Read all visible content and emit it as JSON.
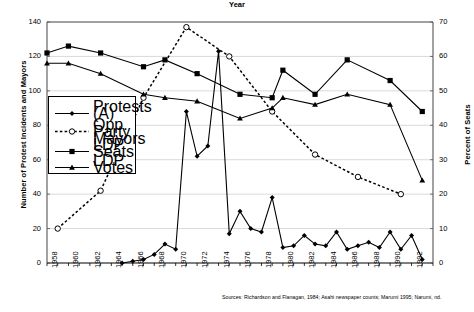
{
  "chart_data": {
    "type": "line",
    "title": "",
    "xlabel": "Year",
    "ylabel": "Number of Protest Incidents and Mayors",
    "ylabel_right": "Percent of Seats",
    "xlim": [
      1958,
      1994
    ],
    "ylim": [
      0,
      140
    ],
    "ylim_right": [
      0,
      70
    ],
    "yticks": [
      0,
      20,
      40,
      60,
      80,
      100,
      120,
      140
    ],
    "yticks_right": [
      0,
      10,
      20,
      30,
      40,
      50,
      60,
      70
    ],
    "xticks": [
      1958,
      1960,
      1962,
      1964,
      1966,
      1968,
      1970,
      1972,
      1974,
      1976,
      1978,
      1980,
      1982,
      1984,
      1986,
      1988,
      1990,
      1992
    ],
    "grid": "horizontal",
    "legend_position": "inside-left",
    "source_note": "Sources: Richardson and Flanagan, 1984; Asahi newspaper counts; Marumi 1995; Narumi, nd.",
    "series": [
      {
        "name": "Protests (A)",
        "axis": "left",
        "marker": "filled-diamond",
        "line": "solid",
        "x": [
          1965,
          1966,
          1967,
          1968,
          1969,
          1970,
          1971,
          1972,
          1973,
          1974,
          1975,
          1976,
          1977,
          1978,
          1979,
          1980,
          1981,
          1982,
          1983,
          1984,
          1985,
          1986,
          1987,
          1988,
          1989,
          1990,
          1991,
          1992,
          1993
        ],
        "values": [
          0,
          1,
          2,
          5,
          11,
          8,
          88,
          62,
          68,
          123,
          17,
          30,
          20,
          18,
          38,
          9,
          10,
          16,
          11,
          10,
          18,
          8,
          10,
          12,
          9,
          18,
          8,
          16,
          2
        ]
      },
      {
        "name": "Opp. Party Mayors",
        "axis": "left",
        "marker": "open-circle",
        "line": "dashed",
        "x": [
          1959,
          1963,
          1967,
          1971,
          1975,
          1979,
          1983,
          1987,
          1991
        ],
        "values": [
          20,
          42,
          96,
          137,
          120,
          88,
          63,
          50,
          40
        ]
      },
      {
        "name": "LDP Seats",
        "axis": "right",
        "marker": "filled-square",
        "line": "solid",
        "x": [
          1958,
          1960,
          1963,
          1967,
          1969,
          1972,
          1976,
          1979,
          1980,
          1983,
          1986,
          1990,
          1993
        ],
        "values": [
          61,
          63,
          61,
          57,
          59,
          55,
          49,
          48,
          56,
          49,
          59,
          53,
          44
        ]
      },
      {
        "name": "LDP Votes",
        "axis": "right",
        "marker": "filled-triangle",
        "line": "solid",
        "x": [
          1958,
          1960,
          1963,
          1967,
          1969,
          1972,
          1976,
          1979,
          1980,
          1983,
          1986,
          1990,
          1993
        ],
        "values": [
          58,
          58,
          55,
          49,
          48,
          47,
          42,
          45,
          48,
          46,
          49,
          46,
          24
        ]
      }
    ]
  },
  "legend": {
    "items": [
      {
        "label_line1": "Protests (A)",
        "label_line2": ""
      },
      {
        "label_line1": "Opp. Party",
        "label_line2": "Mayors"
      },
      {
        "label_line1": "LDP Seats",
        "label_line2": ""
      },
      {
        "label_line1": "LDP Votes",
        "label_line2": ""
      }
    ]
  }
}
